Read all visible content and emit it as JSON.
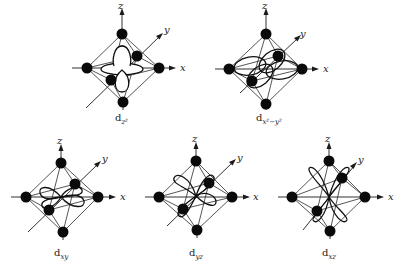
{
  "figure": {
    "axis_labels": {
      "x": "x",
      "y": "y",
      "z": "z"
    },
    "colors": {
      "line": "#2a2a2a",
      "atom": "#0a0a0a",
      "background": "#ffffff"
    },
    "panels": [
      {
        "id": "dz2",
        "label_main": "d",
        "label_sub": "z²",
        "orbital": "d_{z^2}"
      },
      {
        "id": "dx2y2",
        "label_main": "d",
        "label_sub": "x²−y²",
        "orbital": "d_{x^2-y^2}"
      },
      {
        "id": "dxy",
        "label_main": "d",
        "label_sub": "xy",
        "orbital": "d_{xy}"
      },
      {
        "id": "dyz",
        "label_main": "d",
        "label_sub": "yz",
        "orbital": "d_{yz}"
      },
      {
        "id": "dxz",
        "label_main": "d",
        "label_sub": "xz",
        "orbital": "d_{xz}"
      }
    ]
  }
}
